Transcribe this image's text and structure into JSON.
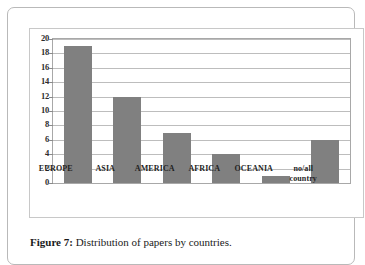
{
  "figure": {
    "caption_label": "Figure 7:",
    "caption_text": " Distribution of papers by countries."
  },
  "chart_data": {
    "type": "bar",
    "title": "",
    "xlabel": "",
    "ylabel": "",
    "categories": [
      "EUROPE",
      "ASIA",
      "AMERICA",
      "AFRICA",
      "OCEANIA",
      "no/all\ncountry"
    ],
    "values": [
      19,
      12,
      7,
      4,
      1,
      6
    ],
    "ylim": [
      0,
      20
    ],
    "ytick_labels": [
      "20",
      "18",
      "16",
      "14",
      "12",
      "10",
      "8",
      "6",
      "4",
      "2",
      "0"
    ],
    "ytick_values": [
      20,
      18,
      16,
      14,
      12,
      10,
      8,
      6,
      4,
      2,
      0
    ],
    "ytick_step": 2,
    "grid": true,
    "grid_axis": "y",
    "legend": false,
    "bar_color": "#808080",
    "grid_color": "#bdbdbd",
    "axis_color": "#a8a8a8",
    "plot_background": "#ffffff"
  }
}
